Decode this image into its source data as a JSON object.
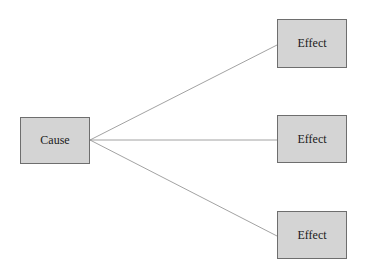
{
  "diagram": {
    "type": "cause-effect",
    "cause": {
      "label": "Cause",
      "x": 20,
      "y": 117,
      "w": 70,
      "h": 47
    },
    "effects": [
      {
        "label": "Effect",
        "x": 277,
        "y": 19,
        "w": 70,
        "h": 49
      },
      {
        "label": "Effect",
        "x": 277,
        "y": 115,
        "w": 70,
        "h": 48
      },
      {
        "label": "Effect",
        "x": 277,
        "y": 211,
        "w": 70,
        "h": 48
      }
    ],
    "colors": {
      "box_fill": "#d4d4d4",
      "box_border": "#6e6e6e",
      "line": "#8a8a8a"
    }
  }
}
